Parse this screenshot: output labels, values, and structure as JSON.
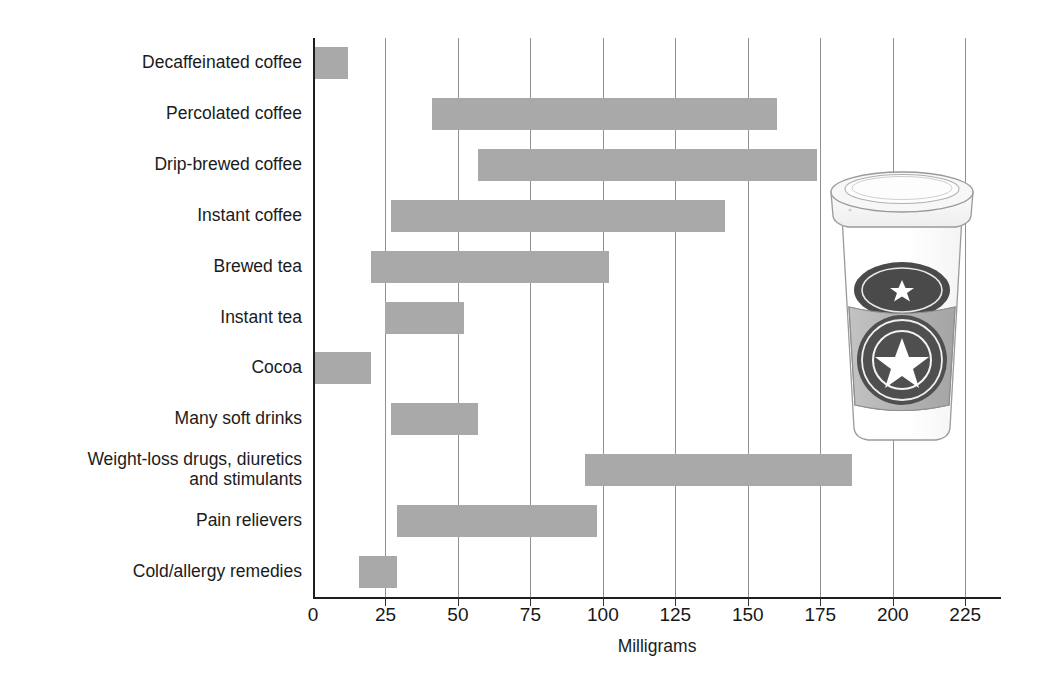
{
  "chart_data": {
    "type": "bar",
    "orientation": "horizontal",
    "subtype": "range-bar",
    "title": "",
    "xlabel": "Milligrams",
    "ylabel": "",
    "xlim": [
      0,
      237
    ],
    "xticks": [
      0,
      25,
      50,
      75,
      100,
      125,
      150,
      175,
      200,
      225
    ],
    "xtick_labels": [
      "0",
      "25",
      "50",
      "75",
      "100",
      "125",
      "150",
      "175",
      "200",
      "225"
    ],
    "grid": "vertical",
    "legend": "none",
    "bar_color": "#a9a9a9",
    "categories": [
      "Decaffeinated coffee",
      "Percolated coffee",
      "Drip-brewed coffee",
      "Instant coffee",
      "Brewed tea",
      "Instant tea",
      "Cocoa",
      "Many soft drinks",
      "Weight-loss drugs, diuretics\nand stimulants",
      "Pain relievers",
      "Cold/allergy remedies"
    ],
    "ranges": [
      {
        "category": "Decaffeinated coffee",
        "low": 0,
        "high": 12
      },
      {
        "category": "Percolated coffee",
        "low": 41,
        "high": 160
      },
      {
        "category": "Drip-brewed coffee",
        "low": 57,
        "high": 174
      },
      {
        "category": "Instant coffee",
        "low": 27,
        "high": 142
      },
      {
        "category": "Brewed tea",
        "low": 20,
        "high": 102
      },
      {
        "category": "Instant tea",
        "low": 25,
        "high": 52
      },
      {
        "category": "Cocoa",
        "low": 0,
        "high": 20
      },
      {
        "category": "Many soft drinks",
        "low": 27,
        "high": 57
      },
      {
        "category": "Weight-loss drugs, diuretics and stimulants",
        "low": 94,
        "high": 186
      },
      {
        "category": "Pain relievers",
        "low": 29,
        "high": 98
      },
      {
        "category": "Cold/allergy remedies",
        "low": 16,
        "high": 29
      }
    ]
  },
  "axis": {
    "x_title": "Milligrams",
    "ticks": [
      "0",
      "25",
      "50",
      "75",
      "100",
      "125",
      "150",
      "175",
      "200",
      "225"
    ]
  },
  "categories": [
    {
      "label": "Decaffeinated coffee"
    },
    {
      "label": "Percolated coffee"
    },
    {
      "label": "Drip-brewed coffee"
    },
    {
      "label": "Instant coffee"
    },
    {
      "label": "Brewed tea"
    },
    {
      "label": "Instant tea"
    },
    {
      "label": "Cocoa"
    },
    {
      "label": "Many soft drinks"
    },
    {
      "label": "Weight-loss drugs, diuretics\nand stimulants"
    },
    {
      "label": "Pain relievers"
    },
    {
      "label": "Cold/allergy remedies"
    }
  ],
  "illustration": {
    "name": "takeaway-coffee-cup",
    "sleeve_color": "#b4b4b4",
    "logo_color": "#4f4f4f",
    "logo_symbol": "star"
  }
}
